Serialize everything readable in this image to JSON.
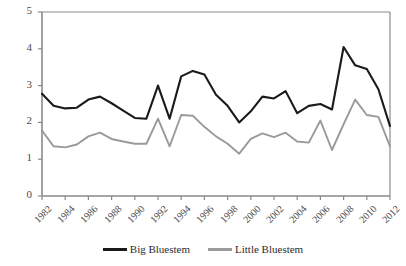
{
  "chart_data": {
    "type": "line",
    "title": "",
    "xlabel": "",
    "ylabel": "Flowering Stalk Height (feet)",
    "x": [
      1982,
      1983,
      1984,
      1985,
      1986,
      1987,
      1988,
      1989,
      1990,
      1991,
      1992,
      1993,
      1994,
      1995,
      1996,
      1997,
      1998,
      1999,
      2000,
      2001,
      2002,
      2003,
      2004,
      2005,
      2006,
      2007,
      2008,
      2009,
      2010,
      2011,
      2012
    ],
    "xlim": [
      1982,
      2012
    ],
    "ylim": [
      0,
      5
    ],
    "yticks": [
      0,
      1,
      2,
      3,
      4,
      5
    ],
    "xticks": [
      1982,
      1984,
      1986,
      1988,
      1990,
      1992,
      1994,
      1996,
      1998,
      2000,
      2002,
      2004,
      2006,
      2008,
      2010,
      2012
    ],
    "grid": false,
    "legend_position": "bottom",
    "series": [
      {
        "name": "Big Bluestem",
        "color": "#1a1a1a",
        "values": [
          2.78,
          2.45,
          2.38,
          2.4,
          2.62,
          2.7,
          2.52,
          2.32,
          2.12,
          2.1,
          3.0,
          2.1,
          3.25,
          3.4,
          3.3,
          2.75,
          2.45,
          2.0,
          2.3,
          2.7,
          2.65,
          2.85,
          2.25,
          2.45,
          2.5,
          2.35,
          4.05,
          3.55,
          3.45,
          2.9,
          1.9
        ]
      },
      {
        "name": "Little Bluestem",
        "color": "#9a9a9a",
        "values": [
          1.78,
          1.35,
          1.32,
          1.4,
          1.62,
          1.72,
          1.55,
          1.48,
          1.42,
          1.42,
          2.1,
          1.35,
          2.2,
          2.18,
          1.88,
          1.62,
          1.42,
          1.15,
          1.55,
          1.7,
          1.6,
          1.72,
          1.48,
          1.45,
          2.05,
          1.25,
          1.95,
          2.62,
          2.2,
          2.15,
          1.35
        ]
      }
    ]
  },
  "ytick_labels": [
    "0",
    "1",
    "2",
    "3",
    "4",
    "5"
  ],
  "xtick_labels": [
    "1982",
    "1984",
    "1986",
    "1988",
    "1990",
    "1992",
    "1994",
    "1996",
    "1998",
    "2000",
    "2002",
    "2004",
    "2006",
    "2008",
    "2010",
    "2012"
  ],
  "legend": {
    "items": [
      {
        "label": "Big Bluestem",
        "color": "#1a1a1a"
      },
      {
        "label": "Little Bluestem",
        "color": "#9a9a9a"
      }
    ]
  },
  "axis": {
    "color": "#8a8a8a"
  }
}
